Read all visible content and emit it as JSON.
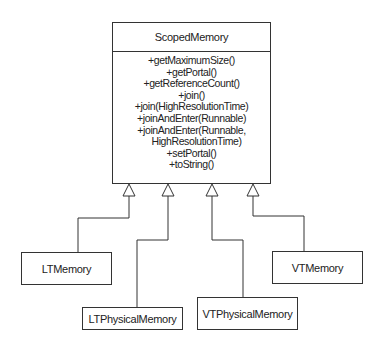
{
  "diagram": {
    "type": "uml-class-inheritance",
    "parent": {
      "name": "ScopedMemory",
      "methods": [
        "+getMaximumSize()",
        "+getPortal()",
        "+getReferenceCount()",
        "+join()",
        "+join(HighResolutionTime)",
        "+joinAndEnter(Runnable)",
        "+joinAndEnter(Runnable,",
        "HighResolutionTime)",
        "+setPortal()",
        "+toString()"
      ]
    },
    "children": [
      {
        "name": "LTMemory"
      },
      {
        "name": "LTPhysicalMemory"
      },
      {
        "name": "VTPhysicalMemory"
      },
      {
        "name": "VTMemory"
      }
    ],
    "relationship": "generalization",
    "colors": {
      "line": "#333333",
      "text": "#222222",
      "background": "#ffffff"
    }
  }
}
